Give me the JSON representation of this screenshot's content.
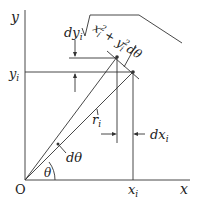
{
  "diagram": {
    "axes": {
      "x_label": "x",
      "y_label": "y",
      "origin_label": "O"
    },
    "labels": {
      "dy": "dy",
      "dy_sub": "i",
      "yi": "y",
      "yi_sub": "i",
      "ri": "r",
      "ri_sub": "i",
      "dx": "dx",
      "dx_sub": "i",
      "xi": "x",
      "xi_sub": "i",
      "dtheta": "dθ",
      "theta": "θ",
      "arc_formula_a": "x",
      "arc_formula_b": "i",
      "arc_formula_c": "2",
      "arc_formula_plus": "+ y",
      "arc_formula_d": "i",
      "arc_formula_e": "2",
      "arc_formula_f": "dθ"
    }
  }
}
